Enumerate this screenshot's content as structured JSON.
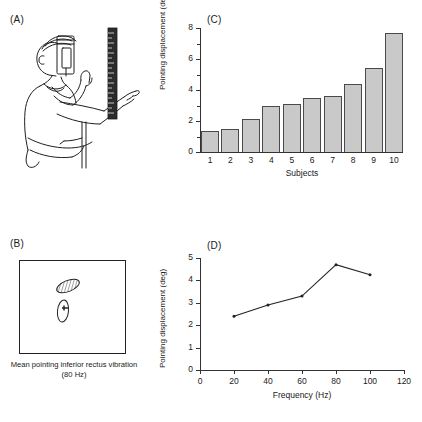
{
  "figure": {
    "panels": [
      {
        "id": "A",
        "label": "(A)"
      },
      {
        "id": "B",
        "label": "(B)"
      },
      {
        "id": "C",
        "label": "(C)"
      },
      {
        "id": "D",
        "label": "(D)"
      }
    ]
  },
  "panel_a": {
    "label": "(A)",
    "description": "Line drawing of a seated subject wearing a head-mounted vibrator device, arm extended, pointing at a vertical graduated scale bar",
    "elements": [
      "seated-subject",
      "head-mounted-device",
      "pointing-arm",
      "vertical-scale-bar",
      "stool"
    ]
  },
  "panel_b": {
    "label": "(B)",
    "caption": "Mean pointing inferior rectus vibration (80 Hz)",
    "markers": [
      {
        "name": "hatched-ellipse",
        "fill": "hatched",
        "tilt_deg": -25
      },
      {
        "name": "open-ellipse",
        "fill": "none",
        "tilt_deg": 5
      }
    ]
  },
  "chart_data": [
    {
      "panel": "C",
      "type": "bar",
      "title": "",
      "categories": [
        "1",
        "2",
        "3",
        "4",
        "5",
        "6",
        "7",
        "8",
        "9",
        "10"
      ],
      "values": [
        1.35,
        1.5,
        2.15,
        3.0,
        3.1,
        3.5,
        3.6,
        4.4,
        5.4,
        7.7
      ],
      "xlabel": "Subjects",
      "ylabel": "Pointing displacement (deg)",
      "ylim": [
        0,
        8
      ],
      "yticks": [
        0,
        2,
        4,
        6,
        8
      ],
      "ytick_labels": [
        "0",
        "2",
        "4",
        "6",
        "8"
      ],
      "grid": false,
      "legend": false,
      "bar_fill": "#c9c9c9",
      "bar_edge": "#4a4a4a"
    },
    {
      "panel": "D",
      "type": "line",
      "title": "",
      "x": [
        20,
        40,
        60,
        80,
        100
      ],
      "values": [
        2.4,
        2.9,
        3.3,
        4.7,
        4.25
      ],
      "xlabel": "Frequency (Hz)",
      "ylabel": "Pointing displacement (deg)",
      "xlim": [
        0,
        120
      ],
      "ylim": [
        0,
        5
      ],
      "xticks": [
        0,
        20,
        40,
        60,
        80,
        100,
        120
      ],
      "xtick_labels": [
        "0",
        "20",
        "40",
        "60",
        "80",
        "100",
        "120"
      ],
      "yticks": [
        0,
        1,
        2,
        3,
        4,
        5
      ],
      "ytick_labels": [
        "0",
        "1",
        "2",
        "3",
        "4",
        "5"
      ],
      "grid": false,
      "legend": false,
      "line_color": "#222222",
      "marker": "dot"
    }
  ]
}
